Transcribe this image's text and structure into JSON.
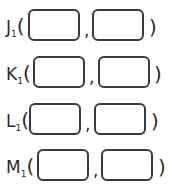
{
  "points": [
    {
      "letter": "J",
      "subscript": "1",
      "open": "(",
      "separator": ",",
      "close": ")",
      "x_value": "",
      "y_value": ""
    },
    {
      "letter": "K",
      "subscript": "1",
      "open": "(",
      "separator": ",",
      "close": ")",
      "x_value": "",
      "y_value": ""
    },
    {
      "letter": "L",
      "subscript": "1",
      "open": "(",
      "separator": ",",
      "close": ")",
      "x_value": "",
      "y_value": ""
    },
    {
      "letter": "M",
      "subscript": "1",
      "open": "(",
      "separator": ",",
      "close": ")",
      "x_value": "",
      "y_value": ""
    }
  ]
}
